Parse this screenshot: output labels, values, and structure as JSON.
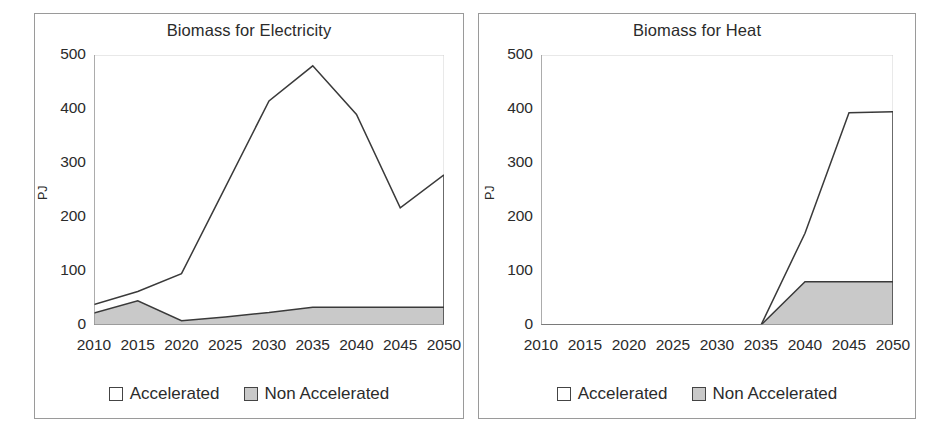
{
  "figure": {
    "panels": [
      "left",
      "right"
    ],
    "background": "#ffffff",
    "border_color": "#9a9a9a"
  },
  "colors": {
    "accelerated_fill": "#ffffff",
    "non_accelerated_fill": "#c9c9c9",
    "line": "#3a3a3a",
    "axis": "#8c8c8c",
    "text": "#2b2b2b"
  },
  "legend": {
    "accelerated_label": "Accelerated",
    "non_accelerated_label": "Non Accelerated"
  },
  "chart_data": [
    {
      "type": "area",
      "id": "biomass-for-electricity",
      "title": "Biomass for Electricity",
      "xlabel": "",
      "ylabel": "PJ",
      "stacked": false,
      "grid": false,
      "legend_position": "bottom",
      "categories": [
        2010,
        2015,
        2020,
        2025,
        2030,
        2035,
        2040,
        2045,
        2050
      ],
      "xticklabels": [
        "2010",
        "2015",
        "2020",
        "2025",
        "2030",
        "2035",
        "2040",
        "2045",
        "2050"
      ],
      "yticklabels": [
        "0",
        "100",
        "200",
        "300",
        "400",
        "500"
      ],
      "yticks": [
        0,
        100,
        200,
        300,
        400,
        500
      ],
      "xlim": [
        2010,
        2050
      ],
      "ylim": [
        0,
        500
      ],
      "series": [
        {
          "name": "Accelerated",
          "values": [
            38,
            62,
            95,
            255,
            415,
            480,
            390,
            217,
            278
          ]
        },
        {
          "name": "Non Accelerated",
          "values": [
            22,
            45,
            8,
            15,
            23,
            33,
            33,
            33,
            33
          ]
        }
      ]
    },
    {
      "type": "area",
      "id": "biomass-for-heat",
      "title": "Biomass for Heat",
      "xlabel": "",
      "ylabel": "PJ",
      "stacked": false,
      "grid": false,
      "legend_position": "bottom",
      "categories": [
        2010,
        2015,
        2020,
        2025,
        2030,
        2035,
        2040,
        2045,
        2050
      ],
      "xticklabels": [
        "2010",
        "2015",
        "2020",
        "2025",
        "2030",
        "2035",
        "2040",
        "2045",
        "2050"
      ],
      "yticklabels": [
        "0",
        "100",
        "200",
        "300",
        "400",
        "500"
      ],
      "yticks": [
        0,
        100,
        200,
        300,
        400,
        500
      ],
      "xlim": [
        2010,
        2050
      ],
      "ylim": [
        0,
        500
      ],
      "series": [
        {
          "name": "Accelerated",
          "values": [
            0,
            0,
            0,
            0,
            0,
            0,
            170,
            393,
            395
          ]
        },
        {
          "name": "Non Accelerated",
          "values": [
            0,
            0,
            0,
            0,
            0,
            0,
            80,
            80,
            80
          ]
        }
      ]
    }
  ]
}
